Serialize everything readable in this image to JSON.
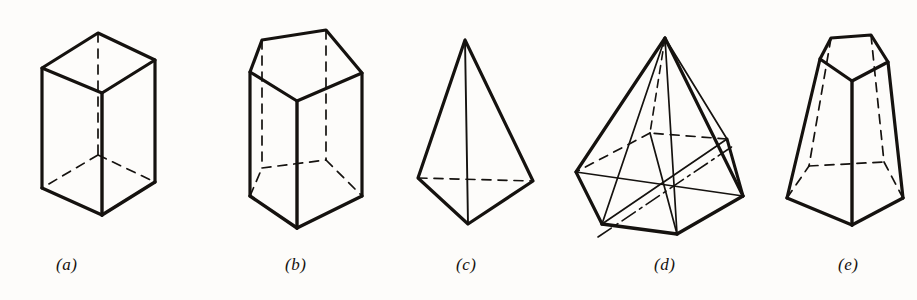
{
  "page": {
    "background_color": "#fdfcfa",
    "ink_color": "#15120f",
    "width": 917,
    "height": 300
  },
  "captions": {
    "a": "(a)",
    "b": "(b)",
    "c": "(c)",
    "d": "(d)",
    "e": "(e)"
  },
  "figures": [
    {
      "id": "a",
      "label": "(a)",
      "name": "cube",
      "description": "Cube (rectangular prism) drawn in oblique projection with hidden edges dashed",
      "visible_faces": [
        "top",
        "front-left",
        "front-right"
      ],
      "hidden_edges": 3,
      "hidden_vertex": "rear-bottom"
    },
    {
      "id": "b",
      "label": "(b)",
      "name": "pentagonal-prism",
      "description": "Pentagonal prism standing upright, hidden rear edges dashed",
      "base_sides": 5,
      "visible_faces": [
        "top-pentagon",
        "front-left",
        "front-right"
      ],
      "hidden_edges": 4
    },
    {
      "id": "c",
      "label": "(c)",
      "name": "tetrahedron",
      "description": "Triangular pyramid (tetrahedron) with one hidden base edge dashed",
      "base_sides": 3,
      "apex": "top",
      "hidden_edges": 1
    },
    {
      "id": "d",
      "label": "(d)",
      "name": "hexagonal-pyramid",
      "description": "Hexagonal pyramid with base diagonals drawn and hidden rear edges dashed",
      "base_sides": 6,
      "apex": "top",
      "diagonals": 3,
      "hidden_edges": 3
    },
    {
      "id": "e",
      "label": "(e)",
      "name": "pentagonal-frustum",
      "description": "Truncated pentagonal pyramid (frustum), hidden rear edges dashed",
      "base_sides": 5,
      "visible_faces": [
        "top-pentagon",
        "front-left",
        "front-right"
      ],
      "hidden_edges": 4
    }
  ]
}
